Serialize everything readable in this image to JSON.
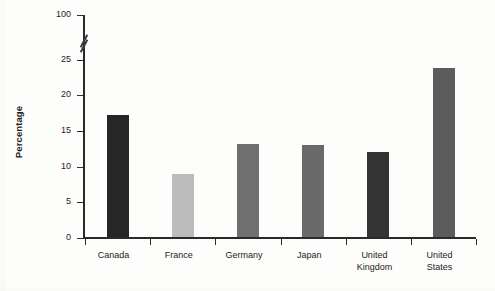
{
  "chart_data": {
    "type": "bar",
    "title": "",
    "xlabel": "",
    "ylabel": "Percentage",
    "categories": [
      "Canada",
      "France",
      "Germany",
      "Japan",
      "United Kingdom",
      "United States"
    ],
    "values": [
      17.1,
      8.8,
      13.0,
      12.9,
      11.9,
      23.7
    ],
    "ylim": [
      0,
      25
    ],
    "yticks": [
      0,
      5,
      10,
      15,
      20,
      25,
      100
    ],
    "ytick_labels": [
      "0",
      "5",
      "10",
      "15",
      "20",
      "25",
      "100"
    ],
    "axis_break": {
      "present": true,
      "between": [
        25,
        100
      ],
      "style": "double-slash"
    },
    "grid": false,
    "legend": false,
    "bar_colors": [
      "#262626",
      "#bcbcbc",
      "#6f6f6f",
      "#6a6a6a",
      "#333333",
      "#5c5c5c"
    ],
    "series": [
      {
        "name": "Percentage",
        "values": [
          17.1,
          8.8,
          13.0,
          12.9,
          11.9,
          23.7
        ]
      }
    ]
  },
  "axis": {
    "y_title": "Percentage"
  },
  "category_lines": [
    [
      "Canada"
    ],
    [
      "France"
    ],
    [
      "Germany"
    ],
    [
      "Japan"
    ],
    [
      "United",
      "Kingdom"
    ],
    [
      "United",
      "States"
    ]
  ]
}
